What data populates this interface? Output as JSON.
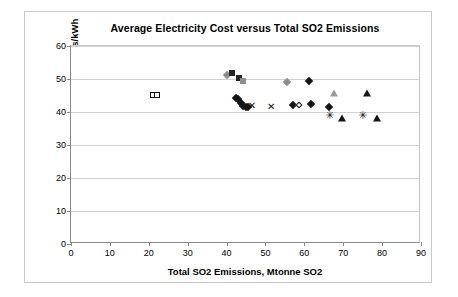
{
  "chart_data": {
    "type": "scatter",
    "title": "Average Electricity Cost versus Total SO2 Emissions",
    "xlabel": "Total SO2 Emissions, Mtonne SO2",
    "ylabel": "Average Electricity Cost, mills/kWh",
    "xlim": [
      0,
      90
    ],
    "ylim": [
      0,
      60
    ],
    "xticks": [
      0,
      10,
      20,
      30,
      40,
      50,
      60,
      70,
      80,
      90
    ],
    "yticks": [
      0,
      10,
      20,
      30,
      40,
      50,
      60
    ],
    "grid": "horizontal",
    "legend": "none",
    "series": [
      {
        "name": "open-square-series",
        "marker": "square-open",
        "color": "#111111",
        "points": [
          {
            "x": 21.0,
            "y": 45.3
          },
          {
            "x": 22.1,
            "y": 45.3
          }
        ]
      },
      {
        "name": "gray-diamond-series",
        "marker": "diamond",
        "color": "#8c8c8c",
        "points": [
          {
            "x": 40.0,
            "y": 51.3
          },
          {
            "x": 55.6,
            "y": 49.2
          }
        ]
      },
      {
        "name": "dark-square-series",
        "marker": "square",
        "color": "#242424",
        "points": [
          {
            "x": 41.5,
            "y": 51.8
          },
          {
            "x": 43.1,
            "y": 50.3
          }
        ]
      },
      {
        "name": "gray-square-series",
        "marker": "square",
        "color": "#8f8f8f",
        "points": [
          {
            "x": 44.2,
            "y": 49.5
          }
        ]
      },
      {
        "name": "dark-diamond-series",
        "marker": "diamond",
        "color": "#151515",
        "points": [
          {
            "x": 42.4,
            "y": 44.3
          },
          {
            "x": 42.9,
            "y": 43.9
          },
          {
            "x": 43.6,
            "y": 42.6
          },
          {
            "x": 44.2,
            "y": 41.8
          },
          {
            "x": 44.9,
            "y": 41.5
          },
          {
            "x": 45.4,
            "y": 41.5
          },
          {
            "x": 57.0,
            "y": 42.0
          },
          {
            "x": 61.1,
            "y": 49.5
          },
          {
            "x": 61.8,
            "y": 42.3
          },
          {
            "x": 66.4,
            "y": 41.5
          }
        ]
      },
      {
        "name": "open-diamond-series",
        "marker": "diamond-open",
        "color": "#111111",
        "points": [
          {
            "x": 58.5,
            "y": 42.0
          }
        ]
      },
      {
        "name": "x-marker-series",
        "marker": "x",
        "color": "#111111",
        "points": [
          {
            "x": 46.5,
            "y": 41.7
          },
          {
            "x": 51.5,
            "y": 41.5
          }
        ]
      },
      {
        "name": "gray-triangle-series",
        "marker": "triangle",
        "color": "#9a9a9a",
        "points": [
          {
            "x": 67.6,
            "y": 45.8
          }
        ]
      },
      {
        "name": "dark-triangle-series",
        "marker": "triangle",
        "color": "#151515",
        "points": [
          {
            "x": 69.6,
            "y": 38.3
          },
          {
            "x": 76.1,
            "y": 45.7
          },
          {
            "x": 78.6,
            "y": 38.2
          }
        ]
      },
      {
        "name": "star-series",
        "marker": "star",
        "color": "#111111",
        "points": [
          {
            "x": 66.5,
            "y": 38.8
          },
          {
            "x": 75.0,
            "y": 38.7
          }
        ]
      }
    ]
  }
}
